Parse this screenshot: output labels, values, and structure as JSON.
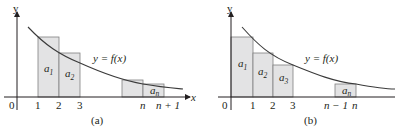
{
  "colors": {
    "rect_fill": "#e3e3e4",
    "rect_stroke": "#808080",
    "axis": "#231f20",
    "curve": "#3a3a3a",
    "text": "#231f20"
  },
  "panel_a": {
    "caption": "(a)",
    "axis_x_label": "x",
    "axis_y_label": "y",
    "origin_label": "0",
    "curve_label": "y = f(x)",
    "ticks": [
      "1",
      "2",
      "3",
      "n",
      "n + 1"
    ],
    "rect_labels": [
      "a",
      "a",
      "a"
    ],
    "rect_subs": [
      "1",
      "2",
      "n"
    ]
  },
  "panel_b": {
    "caption": "(b)",
    "axis_y_label": "y",
    "origin_label": "0",
    "curve_label": "y = f(x)",
    "ticks": [
      "1",
      "2",
      "3",
      "n − 1",
      "n"
    ],
    "rect_labels": [
      "a",
      "a",
      "a",
      "a"
    ],
    "rect_subs": [
      "1",
      "2",
      "3",
      "n"
    ]
  }
}
